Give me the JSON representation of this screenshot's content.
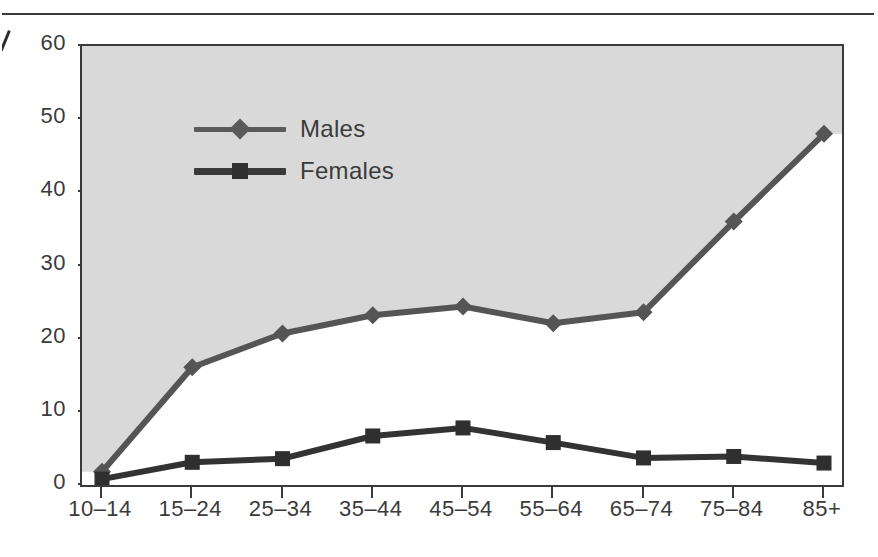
{
  "chart_data": {
    "type": "line",
    "title": "",
    "subtitle": "",
    "xlabel": "",
    "ylabel": "",
    "categories": [
      "10–14",
      "15–24",
      "25–34",
      "35–44",
      "45–54",
      "55–64",
      "65–74",
      "75–84",
      "85+"
    ],
    "series": [
      {
        "name": "Males",
        "marker": "diamond",
        "color": "#555555",
        "values": [
          1.8,
          16.1,
          20.7,
          23.2,
          24.4,
          22.1,
          23.6,
          36.0,
          48.0
        ]
      },
      {
        "name": "Females",
        "marker": "square",
        "color": "#333333",
        "values": [
          0.8,
          3.1,
          3.6,
          6.7,
          7.8,
          5.8,
          3.7,
          3.9,
          3.0
        ]
      }
    ],
    "ylim": [
      0,
      60
    ],
    "yticks": [
      0,
      10,
      20,
      30,
      40,
      50,
      60
    ],
    "ytick_labels": [
      "0",
      "10",
      "20",
      "30",
      "40",
      "50",
      "60"
    ],
    "grid": false,
    "legend_position": "top-left",
    "plot_background": "#d9d9d9",
    "plot_fill_note": "grey shading above the Males line"
  },
  "legend": {
    "items": [
      {
        "label": "Males",
        "marker": "diamond-marker"
      },
      {
        "label": "Females",
        "marker": "square-marker"
      }
    ]
  },
  "axes": {
    "y_labels": [
      "60",
      "50",
      "40",
      "30",
      "20",
      "10",
      "0"
    ],
    "x_labels": [
      "10–14",
      "15–24",
      "25–34",
      "35–44",
      "45–54",
      "55–64",
      "65–74",
      "75–84",
      "85+"
    ]
  },
  "colors": {
    "males_line": "#555555",
    "females_line": "#333333",
    "axis": "#3a3a3a",
    "plot_shade": "#d9d9d9",
    "text": "#3b3b3b"
  }
}
